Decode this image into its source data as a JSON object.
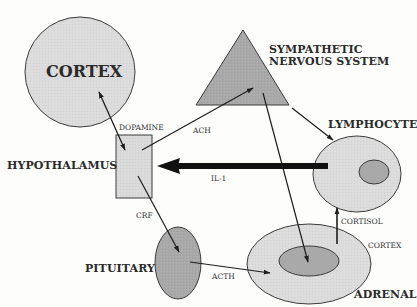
{
  "diagram": {
    "nodes": {
      "cortex": {
        "label": "CORTEX",
        "shape": "circle",
        "fill": "#dcdcdc"
      },
      "sns": {
        "label_line1": "SYMPATHETIC",
        "label_line2": "NERVOUS SYSTEM",
        "shape": "triangle",
        "fill": "#a9a9a9"
      },
      "hypothalamus": {
        "label": "HYPOTHALAMUS",
        "shape": "rectangle",
        "fill": "#dadada"
      },
      "lymphocyte": {
        "label": "LYMPHOCYTE",
        "shape": "ellipse-with-nucleus",
        "fill": "#dcdcdc",
        "nucleus_fill": "#a9a9a9"
      },
      "pituitary": {
        "label": "PITUITARY",
        "shape": "ellipse",
        "fill": "#a9a9a9"
      },
      "adrenal": {
        "label": "ADRENAL",
        "shape": "ellipse-with-inner",
        "fill": "#dcdcdc",
        "inner_fill": "#a9a9a9",
        "outer_label": "CORTEX"
      }
    },
    "edges": [
      {
        "from": "cortex",
        "to": "hypothalamus",
        "label": "DOPAMINE",
        "bidirectional": true
      },
      {
        "from": "hypothalamus",
        "to": "sns",
        "label": "ACH"
      },
      {
        "from": "sns",
        "to": "lymphocyte",
        "label": ""
      },
      {
        "from": "sns",
        "to": "adrenal",
        "label": ""
      },
      {
        "from": "lymphocyte",
        "to": "hypothalamus",
        "label": "IL-1",
        "thick": true
      },
      {
        "from": "hypothalamus",
        "to": "pituitary",
        "label": "CRF"
      },
      {
        "from": "pituitary",
        "to": "adrenal",
        "label": "ACTH"
      },
      {
        "from": "adrenal",
        "to": "lymphocyte",
        "label": "CORTISOL"
      }
    ]
  }
}
